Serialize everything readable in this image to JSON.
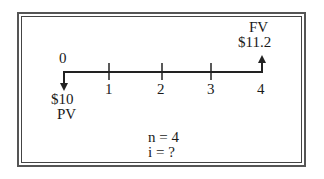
{
  "diagram": {
    "type": "cash-flow timeline",
    "periods": [
      "0",
      "1",
      "2",
      "3",
      "4"
    ],
    "present_value": {
      "amount": "$10",
      "label": "PV",
      "period": "0",
      "direction": "down"
    },
    "future_value": {
      "amount": "$11.2",
      "label": "FV",
      "period": "4",
      "direction": "up"
    },
    "given": {
      "n": "n = 4",
      "i": "i = ?"
    }
  }
}
